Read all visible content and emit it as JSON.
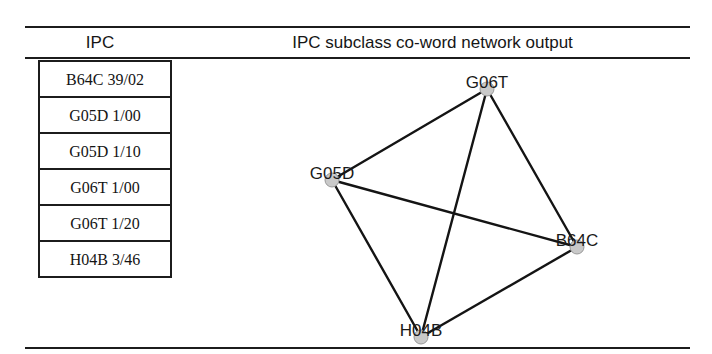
{
  "figure": {
    "header": {
      "left_column_title": "IPC",
      "right_column_title": "IPC subclass co-word network output"
    },
    "ipc_table": {
      "rows": [
        {
          "code": "B64C 39/02"
        },
        {
          "code": "G05D 1/00"
        },
        {
          "code": "G05D 1/10"
        },
        {
          "code": "G06T 1/00"
        },
        {
          "code": "G06T 1/20"
        },
        {
          "code": "H04B 3/46"
        }
      ]
    },
    "network": {
      "node_fill_color": "#c9c9c9",
      "node_stroke_color": "#9a9a9a",
      "edge_color": "#141414",
      "nodes": [
        {
          "id": "G06T",
          "label": "G06T",
          "x": 297,
          "y": 31
        },
        {
          "id": "G05D",
          "label": "G05D",
          "x": 142,
          "y": 122
        },
        {
          "id": "B64C",
          "label": "B64C",
          "x": 387,
          "y": 189
        },
        {
          "id": "H04B",
          "label": "H04B",
          "x": 231,
          "y": 279
        }
      ],
      "edges": [
        {
          "source": "G06T",
          "target": "G05D"
        },
        {
          "source": "G06T",
          "target": "B64C"
        },
        {
          "source": "G06T",
          "target": "H04B"
        },
        {
          "source": "G05D",
          "target": "B64C"
        },
        {
          "source": "G05D",
          "target": "H04B"
        },
        {
          "source": "B64C",
          "target": "H04B"
        }
      ]
    },
    "rules": {
      "top_color": "#1c1c1c",
      "mid_color": "#1c1c1c",
      "bottom_color": "#1c1c1c"
    }
  }
}
